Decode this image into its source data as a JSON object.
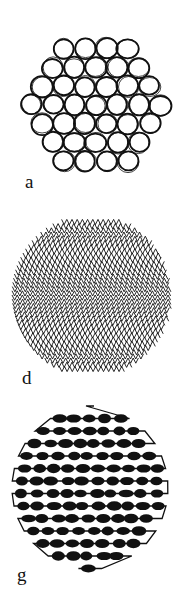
{
  "figure": {
    "background": "#ffffff",
    "ink": "#111111",
    "panels": [
      {
        "id": "a",
        "label": "a",
        "pattern": "packed-circles",
        "description": "Close-packed hand-drawn circles within a round outline"
      },
      {
        "id": "d",
        "label": "d",
        "pattern": "zigzag-mesh",
        "description": "Dense rows of fine zigzag lines within a round outline"
      },
      {
        "id": "g",
        "label": "g",
        "pattern": "beaded-serpentine",
        "description": "A single serpentine thread folded back and forth with dark beaded swellings"
      }
    ]
  }
}
